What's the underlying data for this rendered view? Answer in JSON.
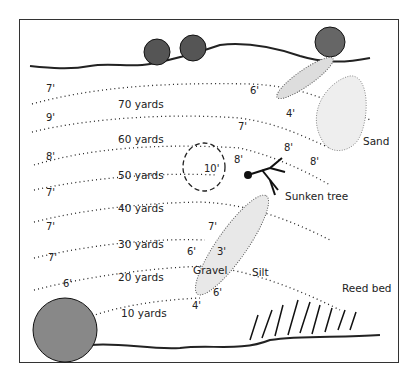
{
  "diagram": {
    "type": "fishing swim depth map",
    "distance_labels": [
      "70 yards",
      "60 yards",
      "50 yards",
      "40 yards",
      "30 yards",
      "20 yards",
      "10 yards"
    ],
    "left_depths": [
      "7'",
      "9'",
      "8'",
      "7'",
      "7'",
      "7'",
      "6'"
    ],
    "features": {
      "sand": "Sand",
      "sunken_tree": "Sunken tree",
      "gravel": "Gravel",
      "silt": "Silt",
      "reed_bed": "Reed bed"
    },
    "spot_depths": {
      "bar_top": "6'",
      "bar_shallow": "4'",
      "row_70_right": "7'",
      "sand_left": "8'",
      "sand_bottom": "8'",
      "hole": "10'",
      "tree_left": "8'",
      "row_40_right": "7'",
      "gravel_left": "6'",
      "gravel_top": "3'",
      "gravel_bottom": "6'",
      "near_margin": "4'"
    },
    "colors": {
      "ink": "#222222",
      "border": "#333333",
      "background": "#ffffff"
    }
  }
}
